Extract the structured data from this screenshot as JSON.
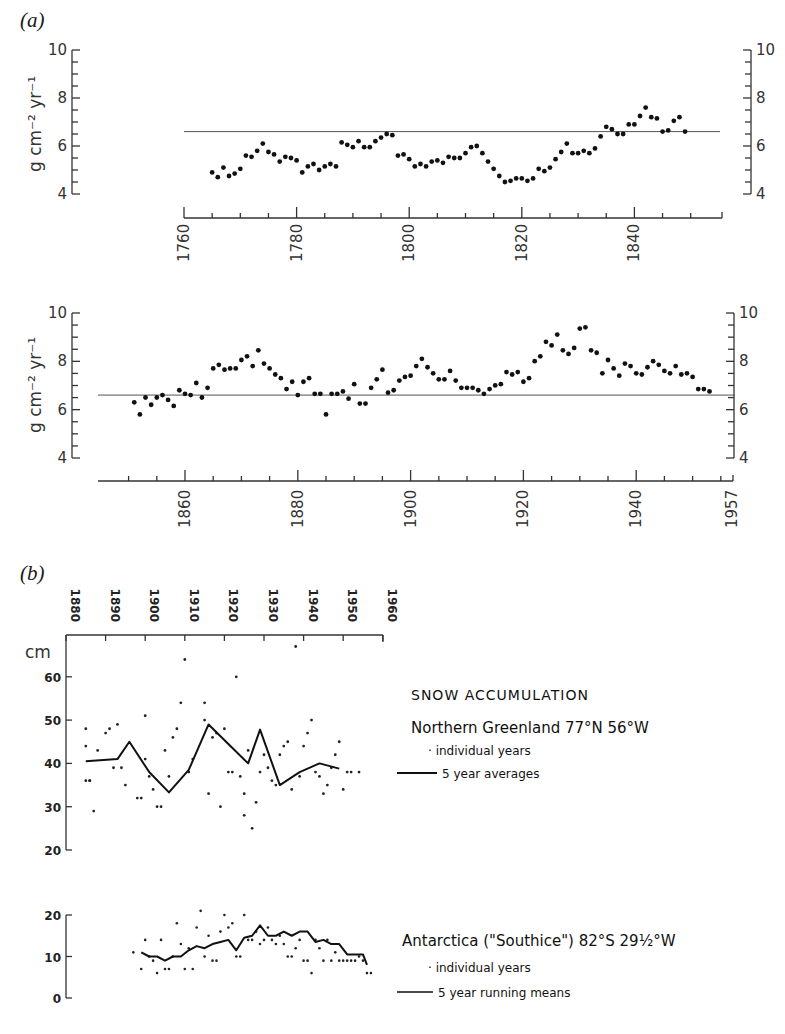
{
  "panel_a": {
    "label": "(a)",
    "y_unit": "g cm⁻² yr⁻¹",
    "top": {
      "y_ticks": [
        "10",
        "8",
        "6",
        "4"
      ],
      "x_ticks": [
        "1760",
        "1780",
        "1800",
        "1820",
        "1840"
      ]
    },
    "bottom": {
      "y_ticks": [
        "10",
        "8",
        "6",
        "4"
      ],
      "x_ticks": [
        "1860",
        "1880",
        "1900",
        "1920",
        "1940",
        "1957"
      ]
    }
  },
  "panel_b": {
    "label": "(b)",
    "x_ticks": [
      "1880",
      "1890",
      "1900",
      "1910",
      "1920",
      "1930",
      "1940",
      "1950",
      "1960"
    ],
    "greenland": {
      "y_unit": "cm",
      "y_ticks": [
        "60",
        "50",
        "40",
        "30",
        "20"
      ],
      "legend_title": "SNOW  ACCUMULATION",
      "legend_location": "Northern  Greenland   77°N  56°W",
      "legend_dots": "· individual years",
      "legend_line": "5 year  averages"
    },
    "antarctica": {
      "y_ticks": [
        "20",
        "10",
        "0"
      ],
      "legend_location": "Antarctica (\"Southice\") 82°S  29½°W",
      "legend_dots": "· individual   years",
      "legend_line": "5 year  running  means"
    }
  },
  "chart_data": [
    {
      "type": "scatter",
      "title": "(a) upper — annual accumulation 1765–1849",
      "xlabel": "Year",
      "ylabel": "g cm⁻² yr⁻¹",
      "xlim": [
        1760,
        1853
      ],
      "ylim": [
        4,
        10
      ],
      "reference_line": 6.6,
      "x": [
        1765,
        1766,
        1767,
        1768,
        1769,
        1770,
        1771,
        1772,
        1773,
        1774,
        1775,
        1776,
        1777,
        1778,
        1779,
        1780,
        1781,
        1782,
        1783,
        1784,
        1785,
        1786,
        1787,
        1788,
        1789,
        1790,
        1791,
        1792,
        1793,
        1794,
        1795,
        1796,
        1797,
        1798,
        1799,
        1800,
        1801,
        1802,
        1803,
        1804,
        1805,
        1806,
        1807,
        1808,
        1809,
        1810,
        1811,
        1812,
        1813,
        1814,
        1815,
        1816,
        1817,
        1818,
        1819,
        1820,
        1821,
        1822,
        1823,
        1824,
        1825,
        1826,
        1827,
        1828,
        1829,
        1830,
        1831,
        1832,
        1833,
        1834,
        1835,
        1836,
        1837,
        1838,
        1839,
        1840,
        1841,
        1842,
        1843,
        1844,
        1845,
        1846,
        1847,
        1848,
        1849
      ],
      "y": [
        4.9,
        4.7,
        5.1,
        4.75,
        4.85,
        5.05,
        5.6,
        5.55,
        5.8,
        6.1,
        5.75,
        5.65,
        5.35,
        5.55,
        5.5,
        5.4,
        4.9,
        5.15,
        5.25,
        5.0,
        5.15,
        5.25,
        5.15,
        6.15,
        6.05,
        5.95,
        6.2,
        5.95,
        5.95,
        6.2,
        6.35,
        6.5,
        6.45,
        5.6,
        5.65,
        5.45,
        5.15,
        5.25,
        5.15,
        5.35,
        5.4,
        5.3,
        5.55,
        5.5,
        5.5,
        5.7,
        5.95,
        6.0,
        5.7,
        5.35,
        5.05,
        4.75,
        4.5,
        4.55,
        4.65,
        4.65,
        4.55,
        4.65,
        5.05,
        4.95,
        5.1,
        5.45,
        5.75,
        6.1,
        5.7,
        5.7,
        5.8,
        5.7,
        5.9,
        6.4,
        6.8,
        6.7,
        6.5,
        6.5,
        6.9,
        6.9,
        7.25,
        7.6,
        7.2,
        7.15,
        6.6,
        6.65,
        7.05,
        7.2,
        6.6,
        6.75,
        6.3
      ]
    },
    {
      "type": "scatter",
      "title": "(a) lower — annual accumulation 1851–1953",
      "xlabel": "Year",
      "ylabel": "g cm⁻² yr⁻¹",
      "xlim": [
        1845,
        1957
      ],
      "ylim": [
        4,
        10
      ],
      "reference_line": 6.6,
      "x": [
        1851,
        1852,
        1853,
        1854,
        1855,
        1856,
        1857,
        1858,
        1859,
        1860,
        1861,
        1862,
        1863,
        1864,
        1865,
        1866,
        1867,
        1868,
        1869,
        1870,
        1871,
        1872,
        1873,
        1874,
        1875,
        1876,
        1877,
        1878,
        1879,
        1880,
        1881,
        1882,
        1883,
        1884,
        1885,
        1886,
        1887,
        1888,
        1889,
        1890,
        1891,
        1892,
        1893,
        1894,
        1895,
        1896,
        1897,
        1898,
        1899,
        1900,
        1901,
        1902,
        1903,
        1904,
        1905,
        1906,
        1907,
        1908,
        1909,
        1910,
        1911,
        1912,
        1913,
        1914,
        1915,
        1916,
        1917,
        1918,
        1919,
        1920,
        1921,
        1922,
        1923,
        1924,
        1925,
        1926,
        1927,
        1928,
        1929,
        1930,
        1931,
        1932,
        1933,
        1934,
        1935,
        1936,
        1937,
        1938,
        1939,
        1940,
        1941,
        1942,
        1943,
        1944,
        1945,
        1946,
        1947,
        1948,
        1949,
        1950,
        1951,
        1952,
        1953
      ],
      "y": [
        6.3,
        5.8,
        6.5,
        6.2,
        6.5,
        6.6,
        6.4,
        6.15,
        6.8,
        6.65,
        6.6,
        7.1,
        6.5,
        6.9,
        7.7,
        7.85,
        7.65,
        7.7,
        7.7,
        8.05,
        8.2,
        7.8,
        8.45,
        7.9,
        7.7,
        7.45,
        7.3,
        6.85,
        7.15,
        6.6,
        7.15,
        7.3,
        6.65,
        6.65,
        5.8,
        6.65,
        6.65,
        6.75,
        6.45,
        7.05,
        6.25,
        6.25,
        6.9,
        7.25,
        7.65,
        6.7,
        6.8,
        7.2,
        7.35,
        7.4,
        7.8,
        8.1,
        7.75,
        7.5,
        7.25,
        7.25,
        7.6,
        7.2,
        6.9,
        6.9,
        6.9,
        6.8,
        6.65,
        6.85,
        7.0,
        7.05,
        7.55,
        7.45,
        7.55,
        7.15,
        7.3,
        8.0,
        8.2,
        8.8,
        8.65,
        9.1,
        8.45,
        8.3,
        8.55,
        9.35,
        9.4,
        8.45,
        8.35,
        7.5,
        8.05,
        7.7,
        7.4,
        7.9,
        7.8,
        7.5,
        7.45,
        7.75,
        8.0,
        7.85,
        7.6,
        7.5,
        7.8,
        7.45,
        7.5,
        7.35,
        6.85,
        6.85,
        6.75
      ]
    },
    {
      "type": "line",
      "title": "(b) Snow accumulation, Northern Greenland 77°N 56°W",
      "xlabel": "Year",
      "ylabel": "cm",
      "xlim": [
        1880,
        1960
      ],
      "ylim": [
        20,
        68
      ],
      "x_ticks": [
        1880,
        1890,
        1900,
        1910,
        1920,
        1930,
        1940,
        1950,
        1960
      ],
      "series": [
        {
          "name": "individual years",
          "style": "dots",
          "x": [
            1885,
            1885,
            1885,
            1886,
            1886,
            1887,
            1888,
            1890,
            1891,
            1892,
            1893,
            1894,
            1895,
            1898,
            1899,
            1900,
            1900,
            1901,
            1902,
            1903,
            1904,
            1905,
            1906,
            1907,
            1908,
            1909,
            1910,
            1911,
            1912,
            1915,
            1915,
            1916,
            1917,
            1918,
            1919,
            1920,
            1921,
            1922,
            1923,
            1924,
            1925,
            1925,
            1926,
            1927,
            1928,
            1929,
            1930,
            1931,
            1932,
            1933,
            1934,
            1935,
            1936,
            1937,
            1938,
            1939,
            1940,
            1941,
            1942,
            1943,
            1944,
            1945,
            1946,
            1947,
            1948,
            1949,
            1950,
            1951,
            1952,
            1954
          ],
          "y": [
            44,
            36,
            48,
            36,
            36,
            29,
            43,
            47,
            48,
            39,
            49,
            39,
            35,
            32,
            32,
            41,
            51,
            37,
            34,
            30,
            30,
            43,
            37,
            46,
            48,
            54,
            64,
            38,
            41,
            50,
            54,
            33,
            46,
            47,
            30,
            48,
            38,
            38,
            60,
            37,
            33,
            28,
            43,
            25,
            31,
            38,
            42,
            39,
            36,
            35,
            42,
            44,
            45,
            34,
            67,
            37,
            44,
            47,
            50,
            38,
            37,
            33,
            35,
            39,
            42,
            45,
            34,
            38,
            38,
            38
          ],
          "note": "approximate scatter of individual annual values"
        },
        {
          "name": "5 year averages",
          "style": "line",
          "x": [
            1885,
            1893,
            1896,
            1901,
            1906,
            1911,
            1916,
            1921,
            1926,
            1929,
            1934,
            1939,
            1944,
            1949
          ],
          "y": [
            40.5,
            41,
            45,
            38,
            33.3,
            38.5,
            49,
            44.5,
            40,
            47.8,
            35,
            38,
            40,
            38.8
          ]
        }
      ]
    },
    {
      "type": "line",
      "title": "(b) Antarctica (\"Southice\") 82°S 29½°W",
      "xlabel": "Year",
      "ylabel": "cm",
      "xlim": [
        1880,
        1960
      ],
      "ylim": [
        0,
        20
      ],
      "series": [
        {
          "name": "individual years",
          "style": "dots",
          "note": "approximately 60 scattered annual values between ~6 and ~21 cm, 1897–1957",
          "x": [
            1897,
            1899,
            1900,
            1901,
            1902,
            1903,
            1904,
            1905,
            1906,
            1907,
            1908,
            1909,
            1910,
            1911,
            1912,
            1913,
            1914,
            1915,
            1916,
            1917,
            1918,
            1919,
            1920,
            1921,
            1922,
            1923,
            1924,
            1925,
            1926,
            1927,
            1928,
            1929,
            1930,
            1931,
            1932,
            1933,
            1934,
            1935,
            1936,
            1937,
            1938,
            1939,
            1940,
            1941,
            1942,
            1943,
            1944,
            1945,
            1946,
            1947,
            1948,
            1949,
            1950,
            1951,
            1952,
            1953,
            1954,
            1955,
            1956,
            1957
          ],
          "y": [
            11,
            7,
            14,
            10,
            9,
            6,
            14,
            7,
            7,
            10,
            18,
            13,
            7,
            12,
            7,
            17,
            21,
            10,
            15,
            9,
            9,
            16,
            20,
            17,
            18,
            10,
            10,
            20,
            14,
            14,
            16,
            13,
            14,
            17,
            14,
            13,
            15,
            13,
            10,
            10,
            12,
            14,
            9,
            9,
            6,
            14,
            12,
            9,
            14,
            9,
            11,
            9,
            9,
            9,
            9,
            9,
            10,
            9,
            6,
            6
          ]
        },
        {
          "name": "5 year running means",
          "style": "line",
          "x": [
            1899,
            1901,
            1903,
            1905,
            1907,
            1909,
            1911,
            1913,
            1915,
            1917,
            1919,
            1921,
            1923,
            1925,
            1927,
            1929,
            1931,
            1933,
            1935,
            1937,
            1939,
            1941,
            1943,
            1945,
            1947,
            1949,
            1951,
            1953,
            1955,
            1956
          ],
          "y": [
            11,
            10,
            10,
            9,
            10,
            10,
            11.5,
            12.5,
            12,
            13,
            13.5,
            14,
            11.5,
            14.5,
            15,
            17.5,
            15,
            15,
            16,
            15,
            16,
            16,
            13.5,
            14,
            13,
            13,
            10.5,
            10.5,
            10.5,
            8
          ]
        }
      ]
    }
  ]
}
